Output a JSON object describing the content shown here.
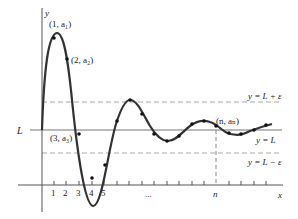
{
  "figure": {
    "axes": {
      "x_label": "x",
      "y_label": "y",
      "tick_labels": [
        "1",
        "2",
        "3",
        "4",
        "5"
      ],
      "ellipsis": "...",
      "n_label": "n"
    },
    "limit_line": {
      "left_label": "L",
      "right_label": "y = L"
    },
    "band": {
      "upper_label": "y = L + ε",
      "lower_label": "y = L − ε"
    },
    "points": {
      "p1": "(1, a₁)",
      "p2": "(2, a₂)",
      "p3": "(3, a₃)",
      "pn": "(n, aₙ)"
    },
    "colors": {
      "curve": "#333333",
      "axis": "#555555",
      "limit_line": "#777777",
      "dashed": "#999999"
    }
  }
}
